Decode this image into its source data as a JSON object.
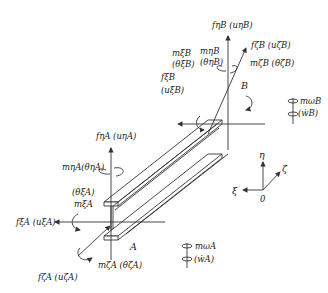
{
  "diagram": {
    "type": "thin-walled I-beam element with end forces, moments and displacements",
    "nodes": {
      "A": {
        "label": "A"
      },
      "B": {
        "label": "B"
      }
    },
    "end_B": {
      "f_eta": "fηB (uηB)",
      "m_eta": "mηB",
      "theta_eta": "(θηB)",
      "f_zeta": "fζB (uζB)",
      "m_zeta": "mζB (θζB)",
      "m_xi": "mξB",
      "theta_xi": "(θξB)",
      "f_xi": "fξB",
      "u_xi": "(uξB)",
      "m_omega": "mωB",
      "w_dot": "(ẇB)"
    },
    "end_A": {
      "f_eta": "fηA (uηA)",
      "m_eta": "mηA(θηA)",
      "theta_xi": "(θξA)",
      "m_xi": "mξA",
      "f_xi": "fξA (uξA)",
      "f_zeta": "fζA (uζA)",
      "m_zeta": "mζA (θζA)",
      "m_omega": "mωA",
      "w_dot": "(ẇA)"
    },
    "axes": {
      "eta": "η",
      "zeta": "ζ",
      "xi": "ξ",
      "origin": "0"
    }
  }
}
